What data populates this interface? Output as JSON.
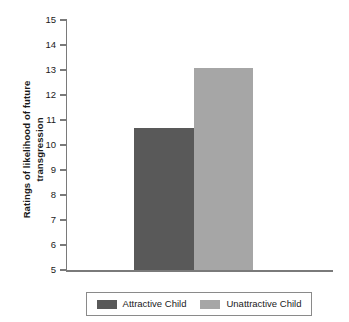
{
  "chart_data": {
    "type": "bar",
    "title": "",
    "xlabel": "",
    "ylabel_line1": "Ratings of likelihood of future",
    "ylabel_line2": "transgression",
    "ylabel": "Ratings of likelihood of future transgression",
    "categories": [
      "Attractive Child",
      "Unattractive Child"
    ],
    "values": [
      10.7,
      13.1
    ],
    "series": [
      {
        "name": "Attractive Child",
        "value": 10.7,
        "color": "#595959"
      },
      {
        "name": "Unattractive Child",
        "value": 13.1,
        "color": "#a6a6a6"
      }
    ],
    "ylim": [
      5,
      15
    ],
    "ytick_step": 1,
    "yticks": [
      "15",
      "14",
      "13",
      "12",
      "11",
      "10",
      "9",
      "8",
      "7",
      "6",
      "5"
    ],
    "xticks": [],
    "grid": false,
    "legend_position": "bottom"
  },
  "legend": {
    "entries": [
      {
        "label": "Attractive Child",
        "color": "#595959"
      },
      {
        "label": "Unattractive Child",
        "color": "#a6a6a6"
      }
    ]
  },
  "colors": {
    "attractive_bar": "#595959",
    "unattractive_bar": "#a6a6a6",
    "axis": "#7a7a7a",
    "text": "#1a1a1a",
    "legend_border": "#8a8a8a",
    "background": "#ffffff"
  }
}
